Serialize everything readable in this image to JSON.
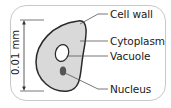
{
  "diagram": {
    "scale": {
      "label": "0.01 mm",
      "orientation": "vertical"
    },
    "labels": {
      "cell_wall": "Cell wall",
      "cytoplasm": "Cytoplasm",
      "vacuole": "Vacuole",
      "nucleus": "Nucleus"
    },
    "colors": {
      "cytoplasm_fill": "#d9d9d9",
      "cell_wall_stroke": "#2a2a2a",
      "vacuole_fill": "#ffffff",
      "nucleus_fill": "#555555",
      "frame_border": "#c8c8c8",
      "leader_line": "#555555"
    }
  }
}
